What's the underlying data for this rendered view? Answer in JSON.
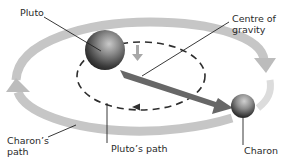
{
  "diagram": {
    "labels": {
      "pluto": "Pluto",
      "centre_line1": "Centre of",
      "centre_line2": "gravity",
      "charons_path_line1": "Charon’s",
      "charons_path_line2": "path",
      "plutos_path": "Pluto’s path",
      "charon": "Charon"
    },
    "colors": {
      "outer_orbit": "#c8c8c8",
      "inner_orbit": "#333333",
      "main_arrow": "#6a6a6a",
      "small_arrow": "#a8a8a8",
      "leader_line": "#222222",
      "text": "#2a2a2a"
    }
  }
}
